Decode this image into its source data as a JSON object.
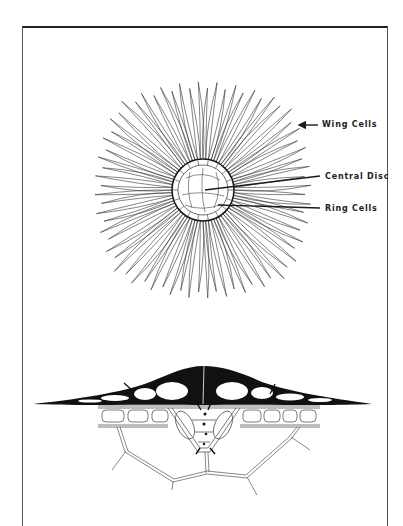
{
  "figure": {
    "type": "botanical-diagram",
    "top_view": {
      "description": "Peltate trichome (scale) seen from above",
      "center": [
        203,
        190
      ],
      "labels": [
        {
          "id": "wing",
          "text": "Wing Cells",
          "x": 322,
          "y": 120,
          "arrow_from": [
            318,
            125
          ],
          "arrow_to": [
            298,
            125
          ]
        },
        {
          "id": "disc",
          "text": "Central Disc",
          "x": 325,
          "y": 172,
          "line_from": [
            320,
            177
          ],
          "line_to": [
            205,
            190
          ]
        },
        {
          "id": "ring",
          "text": "Ring Cells",
          "x": 325,
          "y": 204,
          "line_from": [
            320,
            208
          ],
          "line_to": [
            218,
            205
          ]
        }
      ]
    },
    "cross_section": {
      "description": "Trichome in cross-section on leaf epidermis"
    },
    "colors": {
      "ink": "#1a1a1a",
      "border": "#333333",
      "background": "#ffffff"
    }
  }
}
